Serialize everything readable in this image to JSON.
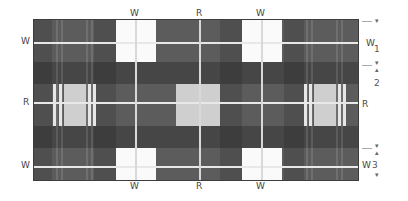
{
  "diagram": {
    "type": "tartan-sett-plan",
    "colors": {
      "background": "#ffffff",
      "ground": "#5c5c5c",
      "dark_band": "#3e3e3e",
      "white_block": "#fafafa",
      "light_block": "#cfcfcf",
      "line": "#e8e8e8"
    },
    "top_labels": [
      "W",
      "R",
      "W"
    ],
    "bottom_labels": [
      "W",
      "R",
      "W"
    ],
    "left_labels": [
      "W",
      "R",
      "W"
    ],
    "right_labels": [
      "W",
      "R",
      "W"
    ],
    "dimension_markers": [
      "1",
      "2",
      "3"
    ]
  }
}
